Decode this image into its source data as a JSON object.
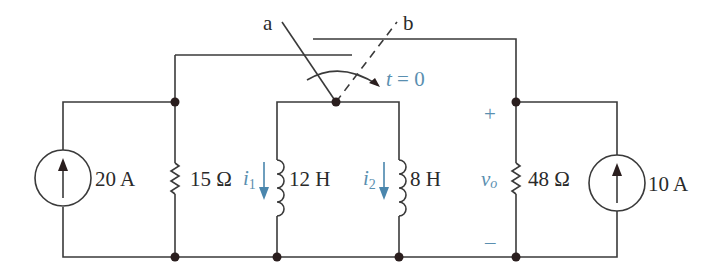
{
  "diagram": {
    "type": "circuit-schematic",
    "colors": {
      "wire": "#3a3a3a",
      "annotation": "#5a8fb0",
      "node": "#2a1e1e"
    },
    "switch": {
      "terminal_a": "a",
      "terminal_b": "b",
      "time_label": "t = 0",
      "time_var": "t",
      "time_rest": " = 0"
    },
    "components": [
      {
        "id": "source-20a",
        "kind": "current-source",
        "label": "20 A",
        "direction": "up"
      },
      {
        "id": "r-15",
        "kind": "resistor",
        "label": "15 Ω"
      },
      {
        "id": "l-12",
        "kind": "inductor",
        "label": "12 H",
        "current_var": "i",
        "current_sub": "1"
      },
      {
        "id": "l-8",
        "kind": "inductor",
        "label": "8 H",
        "current_var": "i",
        "current_sub": "2"
      },
      {
        "id": "r-48",
        "kind": "resistor",
        "label": "48 Ω",
        "voltage_var": "v",
        "voltage_sub": "o"
      },
      {
        "id": "source-10a",
        "kind": "current-source",
        "label": "10 A",
        "direction": "up"
      }
    ],
    "polarity": {
      "plus": "+",
      "minus": "–"
    }
  }
}
